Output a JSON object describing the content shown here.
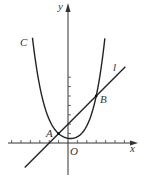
{
  "figure": {
    "axes": {
      "x_label": "x",
      "y_label": "y",
      "origin_label": "O",
      "x_ticks_units": [
        -6,
        -5,
        -4,
        -3,
        -2,
        -1,
        1,
        2,
        3,
        4,
        5,
        6
      ],
      "y_ticks_units": [
        1,
        2,
        3,
        4,
        5,
        6,
        7
      ],
      "x_range": [
        -7,
        8
      ],
      "y_range": [
        -4,
        15
      ]
    },
    "curve": {
      "label": "C",
      "type": "parabola",
      "vertex": [
        0,
        0.5
      ],
      "top_y": 11.3
    },
    "line": {
      "label": "l",
      "slope": 1,
      "intercept": 2,
      "x_from": -4.6,
      "x_to": 6.1
    },
    "points": [
      {
        "label": "A",
        "x": -1,
        "y": 1
      },
      {
        "label": "B",
        "x": 3,
        "y": 5
      }
    ]
  }
}
